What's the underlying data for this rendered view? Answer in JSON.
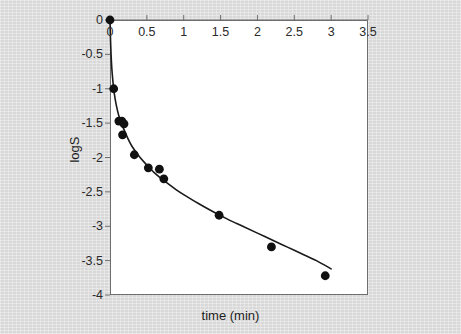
{
  "chart_data": {
    "type": "scatter",
    "title": "",
    "subtitle": "",
    "xlabel": "time (min)",
    "ylabel": "logS",
    "xlim": [
      0,
      3.5
    ],
    "ylim": [
      -4,
      0
    ],
    "grid": false,
    "legend": null,
    "x_axis_position": "top",
    "y_axis_position": "left",
    "xticks": [
      0,
      0.5,
      1,
      1.5,
      2,
      2.5,
      3,
      3.5
    ],
    "xticklabels": [
      "0",
      "0.5",
      "1",
      "1.5",
      "2",
      "2.5",
      "3",
      "3.5"
    ],
    "yticks": [
      0,
      -0.5,
      -1,
      -1.5,
      -2,
      -2.5,
      -3,
      -3.5,
      -4
    ],
    "yticklabels": [
      "0",
      "-0.5",
      "-1",
      "-1.5",
      "-2",
      "-2.5",
      "-3",
      "-3.5",
      "-4"
    ],
    "series": [
      {
        "name": "observed",
        "type": "scatter",
        "marker": "circle",
        "color": "#111111",
        "x": [
          0.0,
          0.05,
          0.12,
          0.16,
          0.19,
          0.17,
          0.33,
          0.52,
          0.67,
          0.73,
          1.48,
          2.19,
          2.92
        ],
        "y": [
          0.0,
          -1.0,
          -1.47,
          -1.47,
          -1.51,
          -1.67,
          -1.96,
          -2.15,
          -2.17,
          -2.31,
          -2.84,
          -3.3,
          -3.72
        ]
      },
      {
        "name": "fitted curve",
        "type": "line",
        "color": "#1a1a1a",
        "x": [
          0.0,
          0.01,
          0.02,
          0.03,
          0.05,
          0.07,
          0.1,
          0.13,
          0.16,
          0.2,
          0.25,
          0.3,
          0.4,
          0.5,
          0.6,
          0.7,
          0.8,
          0.9,
          1.0,
          1.2,
          1.4,
          1.6,
          1.8,
          2.0,
          2.2,
          2.4,
          2.6,
          2.8,
          3.0
        ],
        "y": [
          0.0,
          -0.38,
          -0.62,
          -0.78,
          -1.0,
          -1.15,
          -1.31,
          -1.43,
          -1.52,
          -1.62,
          -1.74,
          -1.84,
          -1.99,
          -2.11,
          -2.22,
          -2.31,
          -2.39,
          -2.47,
          -2.54,
          -2.67,
          -2.79,
          -2.9,
          -3.0,
          -3.1,
          -3.2,
          -3.3,
          -3.4,
          -3.5,
          -3.62
        ]
      }
    ]
  },
  "axes": {
    "x_title": "time (min)",
    "y_title": "logS"
  },
  "colors": {
    "background": "#d8d8d8",
    "plot_background": "#ffffff",
    "axis": "#6e6e6e",
    "marker": "#111111",
    "curve": "#1a1a1a",
    "text": "#1d1d1d"
  }
}
